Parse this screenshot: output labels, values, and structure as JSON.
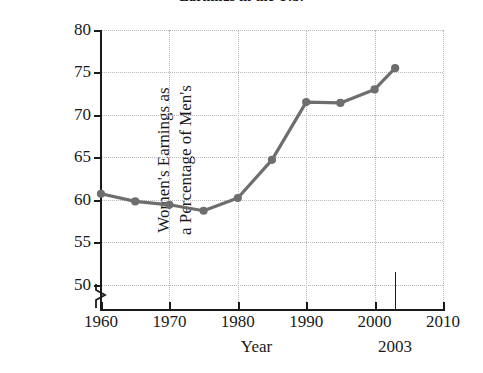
{
  "chart_data": {
    "type": "line",
    "title": "Earnings in the U.S.",
    "xlabel": "Year",
    "ylabel_line1": "Women's Earnings as",
    "ylabel_line2": "a Percentage of Men's",
    "x": [
      1960,
      1965,
      1970,
      1975,
      1980,
      1985,
      1990,
      1995,
      2000,
      2003
    ],
    "values": [
      60.7,
      59.8,
      59.4,
      58.7,
      60.2,
      64.7,
      71.5,
      71.4,
      73.0,
      75.5
    ],
    "series": [
      {
        "name": "Women's earnings as a percentage of men's",
        "values": [
          60.7,
          59.8,
          59.4,
          58.7,
          60.2,
          64.7,
          71.5,
          71.4,
          73.0,
          75.5
        ]
      }
    ],
    "xlim": [
      1960,
      2010
    ],
    "ylim": [
      47,
      80
    ],
    "xticks": [
      1960,
      1970,
      1980,
      1990,
      2000,
      2010
    ],
    "xtick_labels": [
      "1960",
      "1970",
      "1980",
      "1990",
      "2000",
      "2010"
    ],
    "yticks": [
      50,
      55,
      60,
      65,
      70,
      75,
      80
    ],
    "ytick_labels": [
      "50",
      "55",
      "60",
      "65",
      "70",
      "75",
      "80"
    ],
    "grid": true,
    "legend": "none",
    "y_axis_break": true,
    "annotations": [
      {
        "label": "2003",
        "x": 2003,
        "kind": "vertical-tick-marker"
      }
    ],
    "line_color": "#6e6e6e",
    "marker_color": "#6e6e6e",
    "grid_color": "#b9b9b9",
    "axis_color": "#1a1a1a"
  }
}
